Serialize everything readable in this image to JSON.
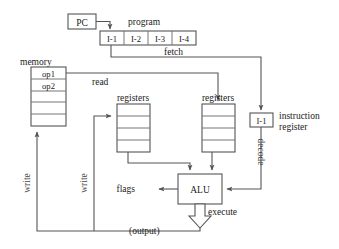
{
  "diagram": {
    "colors": {
      "line": "#555555",
      "cell_line": "#777777",
      "text": "#1a1a1a",
      "vertical_label_text": "#4a4a4a",
      "background": "#ffffff"
    },
    "blocks": {
      "pc": {
        "label": "PC"
      },
      "program": {
        "title": "program",
        "cells": [
          "I-1",
          "I-2",
          "I-3",
          "I-4"
        ]
      },
      "memory": {
        "title": "memory",
        "cells": [
          "op1",
          "op2",
          "",
          "",
          ""
        ]
      },
      "registers_left": {
        "title": "registers",
        "cells": [
          "",
          "",
          "",
          ""
        ]
      },
      "registers_right": {
        "title": "registers",
        "cells": [
          "",
          "",
          "",
          ""
        ]
      },
      "instruction_register": {
        "value": "I-1",
        "title_line1": "instruction",
        "title_line2": "register"
      },
      "alu": {
        "label": "ALU"
      }
    },
    "edge_labels": {
      "fetch": "fetch",
      "read": "read",
      "decode": "decode",
      "execute": "execute",
      "flags": "flags",
      "output": "(output)",
      "write_memory": "write",
      "write_registers": "write"
    }
  }
}
